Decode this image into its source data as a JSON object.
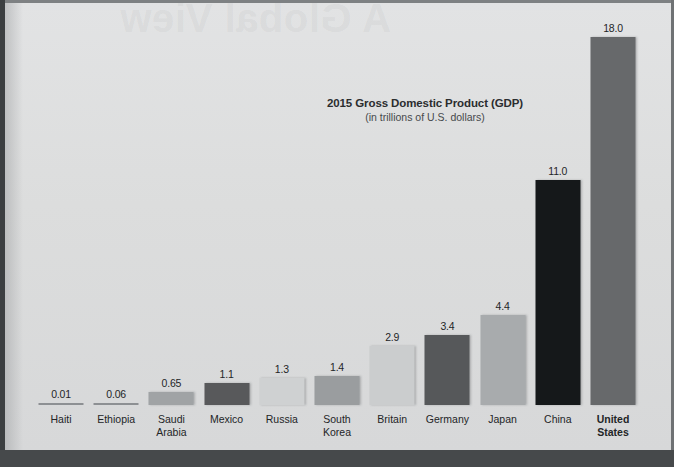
{
  "page": {
    "ghost_text": "A Global View"
  },
  "chart_data": {
    "type": "bar",
    "title": "2015 Gross Domestic Product (GDP)",
    "subtitle": "(in trillions of U.S. dollars)",
    "xlabel": "",
    "ylabel": "",
    "ylim": [
      0,
      18
    ],
    "grid": false,
    "legend": "none",
    "categories": [
      "Haiti",
      "Ethiopia",
      "Saudi\nArabia",
      "Mexico",
      "Russia",
      "South\nKorea",
      "Britain",
      "Germany",
      "Japan",
      "China",
      "United\nStates"
    ],
    "values": [
      0.01,
      0.06,
      0.65,
      1.1,
      1.3,
      1.4,
      2.9,
      3.4,
      4.4,
      11.0,
      18.0
    ],
    "value_labels": [
      "0.01",
      "0.06",
      "0.65",
      "1.1",
      "1.3",
      "1.4",
      "2.9",
      "3.4",
      "4.4",
      "11.0",
      "18.0"
    ],
    "bar_colors": [
      "#8d9093",
      "#8d9093",
      "#a0a3a5",
      "#58595b",
      "#cfd1d2",
      "#9a9d9f",
      "#cbcdce",
      "#56585a",
      "#a8abad",
      "#15181a",
      "#67696b"
    ],
    "emphasized": [
      "United\nStates"
    ]
  }
}
